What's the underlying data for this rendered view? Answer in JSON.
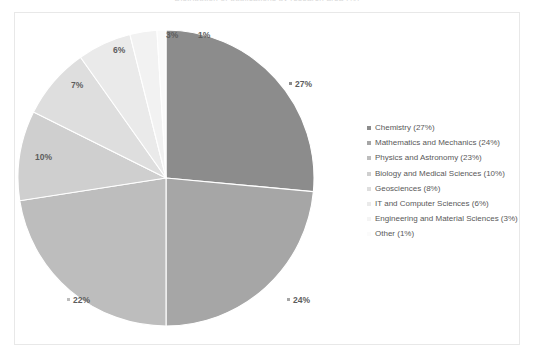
{
  "chart_title": "Distribution of publications by research area (%)",
  "colors": {
    "background": "#ffffff",
    "frame_border": "#e8e8e8",
    "text": "#595959",
    "slice_separator": "#ffffff"
  },
  "chart_data": {
    "type": "pie",
    "title": "Distribution of publications by research area (%)",
    "xlabel": "",
    "ylabel": "",
    "legend_position": "right",
    "grid": false,
    "start_angle_deg": 0,
    "direction": "clockwise",
    "categories": [
      "Chemistry",
      "Mathematics and Mechanics",
      "Physics and Astronomy",
      "Biology and Medical Sciences",
      "Geosciences",
      "IT and Computer Sciences",
      "Engineering and Material Sciences",
      "Other"
    ],
    "values": [
      27,
      24,
      23,
      10,
      8,
      6,
      3,
      1
    ],
    "data_labels": [
      "27%",
      "24%",
      "22%",
      "10%",
      "7%",
      "6%",
      "3%",
      "1%"
    ],
    "slice_colors": [
      "#8c8c8c",
      "#a6a6a6",
      "#bdbdbd",
      "#cfcfcf",
      "#dedede",
      "#eaeaea",
      "#f2f2f2",
      "#fafafa"
    ]
  },
  "legend": {
    "items": [
      {
        "label": "Chemistry (27%)",
        "color": "#8c8c8c"
      },
      {
        "label": "Mathematics and Mechanics (24%)",
        "color": "#a6a6a6"
      },
      {
        "label": "Physics and Astronomy (23%)",
        "color": "#bdbdbd"
      },
      {
        "label": "Biology and Medical Sciences (10%)",
        "color": "#cfcfcf"
      },
      {
        "label": "Geosciences (8%)",
        "color": "#dedede"
      },
      {
        "label": "IT and Computer Sciences (6%)",
        "color": "#eaeaea"
      },
      {
        "label": "Engineering and Material Sciences (3%)",
        "color": "#f4f4f4"
      },
      {
        "label": "Other (1%)",
        "color": "#fbfbfb"
      }
    ]
  }
}
